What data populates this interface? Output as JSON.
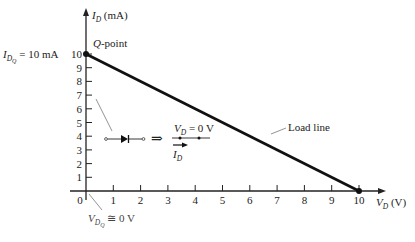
{
  "chart_data": {
    "type": "line",
    "title": "",
    "xlabel": "V_D (V)",
    "ylabel": "I_D (mA)",
    "xlim": [
      0,
      10
    ],
    "ylim": [
      0,
      10
    ],
    "x_ticks": [
      0,
      1,
      2,
      3,
      4,
      5,
      6,
      7,
      8,
      9,
      10
    ],
    "y_ticks": [
      1,
      2,
      3,
      4,
      5,
      6,
      7,
      8,
      9,
      10
    ],
    "grid": false,
    "legend": null,
    "series": [
      {
        "name": "Load line",
        "x": [
          0,
          10
        ],
        "y": [
          10,
          0
        ]
      }
    ],
    "points": [
      {
        "name": "Q-point",
        "x": 0,
        "y": 10
      },
      {
        "name": "x-intercept",
        "x": 10,
        "y": 0
      }
    ],
    "annotations": [
      "Q-point",
      "I_DQ = 10 mA",
      "V_DQ ≅ 0 V",
      "Load line",
      "Diode ⇒ short circuit: V_D = 0 V, I_D"
    ]
  },
  "labels": {
    "y_axis_main": "I",
    "y_axis_sub": "D",
    "y_axis_unit": " (mA)",
    "x_axis_main": "V",
    "x_axis_sub": "D",
    "x_axis_unit": " (V)",
    "q_point": "-point",
    "q_point_letter": "Q",
    "idq_main": "I",
    "idq_sub": "D",
    "idq_subsub": "Q",
    "idq_value": " = 10 mA",
    "vdq_main": "V",
    "vdq_sub": "D",
    "vdq_subsub": "Q",
    "vdq_value": " ≅ 0 V",
    "load_line": "Load line",
    "short_vd_main": "V",
    "short_vd_sub": "D",
    "short_vd_value": " = 0 V",
    "short_id_main": "I",
    "short_id_sub": "D",
    "implies": "⇒"
  },
  "ticks": {
    "x": [
      "0",
      "1",
      "2",
      "3",
      "4",
      "5",
      "6",
      "7",
      "8",
      "9",
      "10"
    ],
    "y": [
      "1",
      "2",
      "3",
      "4",
      "5",
      "6",
      "7",
      "8",
      "9",
      "10"
    ]
  },
  "colors": {
    "axis": "#222222",
    "load_line": "#111111",
    "leader": "#777777"
  }
}
